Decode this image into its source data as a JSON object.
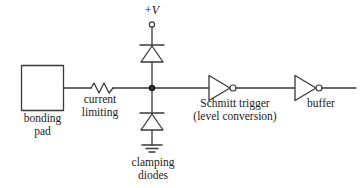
{
  "diagram": {
    "background_color": "#ffffff",
    "line_color": "#3a3a3a",
    "text_color": "#1a1a1a"
  },
  "labels": {
    "bonding_pad": "bonding\npad",
    "bonding_pad_line1": "bonding",
    "bonding_pad_line2": "pad",
    "current_limiting_line1": "current",
    "current_limiting_line2": "limiting",
    "supply_plus": "+",
    "supply_v": "V",
    "clamping_diodes_line1": "clamping",
    "clamping_diodes_line2": "diodes",
    "schmitt_trigger_line1": "Schmitt trigger",
    "schmitt_trigger_line2": "(level conversion)",
    "buffer": "buffer"
  },
  "components": [
    {
      "id": "bonding-pad",
      "type": "pad",
      "label": "bonding pad",
      "shape": "square"
    },
    {
      "id": "current-limiting-resistor",
      "type": "resistor",
      "label": "current limiting",
      "shape": "zigzag"
    },
    {
      "id": "upper-clamping-diode",
      "type": "diode",
      "label": "clamping diode to +V",
      "orientation": "bar-top-apex-up"
    },
    {
      "id": "lower-clamping-diode",
      "type": "diode",
      "label": "clamping diode to ground",
      "orientation": "bar-top-apex-up"
    },
    {
      "id": "supply-terminal",
      "type": "terminal",
      "label": "+V"
    },
    {
      "id": "ground-symbol",
      "type": "ground",
      "label": "ground"
    },
    {
      "id": "junction-node",
      "type": "junction-dot",
      "label": "signal node"
    },
    {
      "id": "schmitt-trigger",
      "type": "inverter",
      "label": "Schmitt trigger (level conversion)"
    },
    {
      "id": "buffer",
      "type": "inverter",
      "label": "buffer"
    }
  ]
}
